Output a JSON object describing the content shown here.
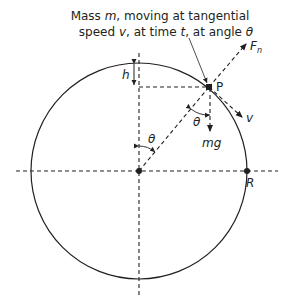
{
  "diagram": {
    "caption_line1_parts": [
      "Mass ",
      "m",
      ", moving at tangential"
    ],
    "caption_line2_parts": [
      "speed ",
      "v",
      ", at time ",
      "t",
      ", at angle ",
      "θ"
    ],
    "labels": {
      "point": "P",
      "normal_force": "F",
      "normal_force_subscript": "n",
      "velocity": "v",
      "gravity": "mg",
      "height": "h",
      "radius": "R",
      "angle_at_center": "θ",
      "angle_at_point": "θ"
    },
    "geometry": {
      "center": [
        139,
        171
      ],
      "radius": 108,
      "angle_deg": 40
    },
    "colors": {
      "stroke": "#231f20",
      "background": "#ffffff"
    }
  }
}
